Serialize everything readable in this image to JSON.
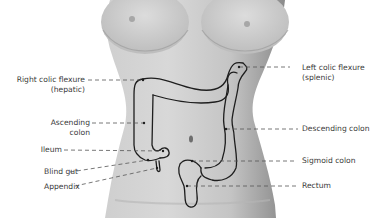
{
  "figure": {
    "colors": {
      "torso_light": "#d9d9d9",
      "torso_mid": "#bcbcbc",
      "torso_shadow": "#8f8f8f",
      "outline": "#1e1e1e",
      "leader": "#555555",
      "text": "#3a3a3a"
    }
  },
  "labels": {
    "left": [
      {
        "id": "right-colic-flexure",
        "line1": "Right colic flexure",
        "line2": "(hepatic)"
      },
      {
        "id": "ascending-colon",
        "line1": "Ascending",
        "line2": "colon"
      },
      {
        "id": "ileum",
        "line1": "Ileum"
      },
      {
        "id": "blind-gut",
        "line1": "Blind gut"
      },
      {
        "id": "appendix",
        "line1": "Appendix"
      }
    ],
    "right": [
      {
        "id": "left-colic-flexure",
        "line1": "Left colic flexure",
        "line2": "(splenic)"
      },
      {
        "id": "descending-colon",
        "line1": "Descending colon"
      },
      {
        "id": "sigmoid-colon",
        "line1": "Sigmoid colon"
      },
      {
        "id": "rectum",
        "line1": "Rectum"
      }
    ]
  }
}
